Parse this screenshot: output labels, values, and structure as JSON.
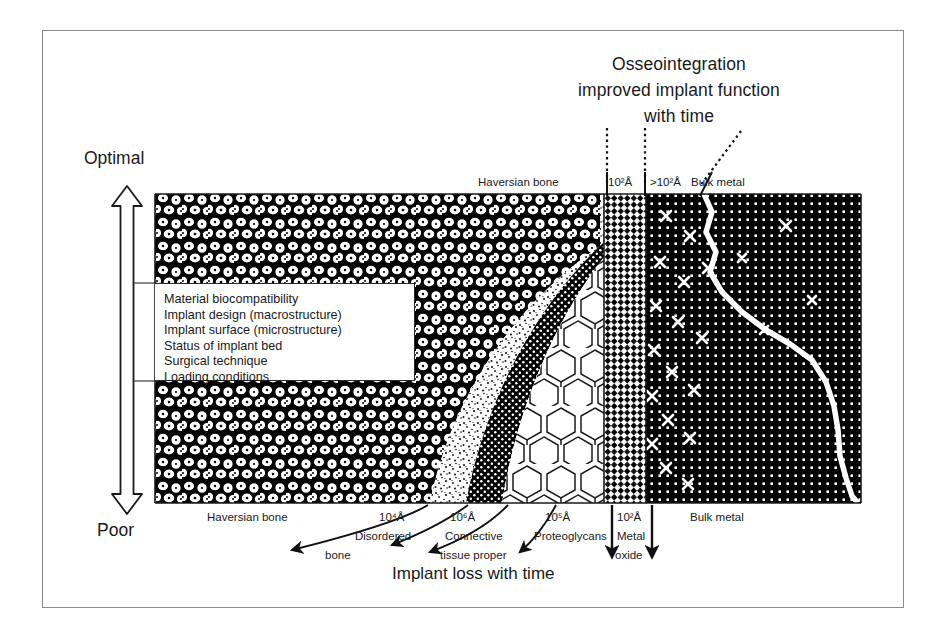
{
  "figure": {
    "type": "diagram",
    "title_lines": [
      "Osseointegration",
      "improved implant function",
      "with time"
    ],
    "bottom_caption": "Implant loss with time"
  },
  "axis": {
    "top_label": "Optimal",
    "bottom_label": "Poor",
    "orientation": "vertical",
    "arrow": "double-headed"
  },
  "factors_box": {
    "items": [
      "Material biocompatibility",
      "Implant design (macrostructure)",
      "Implant surface (microstructure)",
      "Status of implant bed",
      "Surgical technique",
      "Loading conditions"
    ]
  },
  "top_labels": [
    {
      "text": "Haversian bone"
    },
    {
      "text": "10",
      "sup": "2",
      "unit": "Å"
    },
    {
      "text": ">10",
      "sup": "2",
      "unit": "Å"
    },
    {
      "text": "Bulk metal"
    }
  ],
  "top_labels_flat": {
    "haversian": "Haversian bone",
    "oxide_scale": "10²Å",
    "interface_scale": ">10²Å",
    "bulk_metal": "Bulk metal"
  },
  "bottom_labels": {
    "haversian": "Haversian bone",
    "disordered_scale": "10⁴Å",
    "disordered_1": "Disordered",
    "disordered_2": "bone",
    "connective_scale": "10⁶Å",
    "connective_1": "Connective",
    "connective_2": "tissue proper",
    "proteo_scale": "10⁵Å",
    "proteo": "Proteoglycans",
    "oxide_scale": "10²Å",
    "oxide_1": "Metal",
    "oxide_2": "oxide",
    "bulk_metal": "Bulk metal"
  },
  "zones": [
    {
      "name": "haversian-bone",
      "texture": "osteon-cells"
    },
    {
      "name": "disordered-bone",
      "texture": "fine-stipple"
    },
    {
      "name": "connective-tissue",
      "texture": "dense-dark-dots"
    },
    {
      "name": "proteoglycans",
      "texture": "honeycomb"
    },
    {
      "name": "metal-oxide",
      "texture": "diamond-checker"
    },
    {
      "name": "bulk-metal",
      "texture": "crystal-lattice-grid"
    }
  ],
  "colors": {
    "ink": "#1a1a1a",
    "frame": "#8a8a8a",
    "paper": "#ffffff",
    "dark": "#000000"
  }
}
